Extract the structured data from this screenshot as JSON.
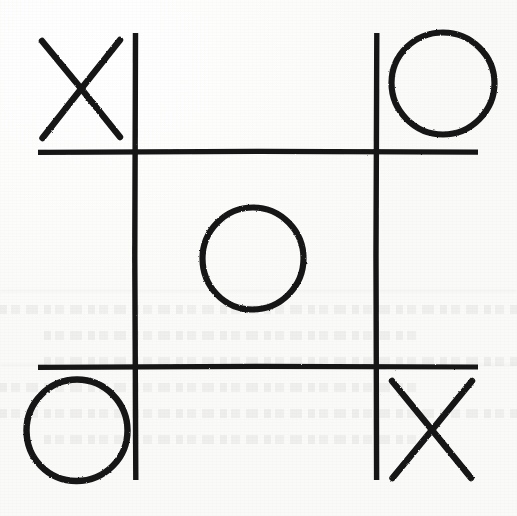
{
  "board": {
    "title": "Tic-Tac-Toe",
    "size": 3,
    "medium": "hand-drawn on paper",
    "ink_color": "#141414",
    "paper_color": "#fdfdfd",
    "stroke_width": 5,
    "grid": {
      "vertical_lines_x": [
        135.5,
        376.5
      ],
      "horizontal_lines_y": [
        152,
        367
      ],
      "vertical_extent_y": [
        33,
        480
      ],
      "horizontal_extent_x": [
        38,
        478
      ]
    },
    "cells": [
      {
        "index": 0,
        "row": 0,
        "col": 1,
        "position": "top-left",
        "mark": "X",
        "label": "X",
        "cx": 81,
        "cy": 89,
        "r": 50
      },
      {
        "index": 1,
        "row": 0,
        "col": 2,
        "position": "top-center",
        "mark": "",
        "label": "",
        "cx": 256,
        "cy": 89,
        "r": 50
      },
      {
        "index": 2,
        "row": 0,
        "col": 3,
        "position": "top-right",
        "mark": "O",
        "label": "O",
        "cx": 443,
        "cy": 83,
        "r": 51
      },
      {
        "index": 3,
        "row": 1,
        "col": 1,
        "position": "middle-left",
        "mark": "",
        "label": "",
        "cx": 81,
        "cy": 259,
        "r": 50
      },
      {
        "index": 4,
        "row": 1,
        "col": 2,
        "position": "middle-center",
        "mark": "O",
        "label": "O",
        "cx": 253,
        "cy": 258,
        "r": 50
      },
      {
        "index": 5,
        "row": 1,
        "col": 3,
        "position": "middle-right",
        "mark": "",
        "label": "",
        "cx": 430,
        "cy": 259,
        "r": 50
      },
      {
        "index": 6,
        "row": 2,
        "col": 1,
        "position": "bottom-left",
        "mark": "O",
        "label": "O",
        "cx": 77,
        "cy": 430,
        "r": 50
      },
      {
        "index": 7,
        "row": 2,
        "col": 2,
        "position": "bottom-center",
        "mark": "",
        "label": "",
        "cx": 256,
        "cy": 430,
        "r": 50
      },
      {
        "index": 8,
        "row": 2,
        "col": 3,
        "position": "bottom-right",
        "mark": "X",
        "label": "X",
        "cx": 432,
        "cy": 430,
        "r": 50
      }
    ],
    "marks_summary": {
      "x_count": 2,
      "o_count": 3,
      "empty_count": 4,
      "x_positions": [
        "top-left",
        "bottom-right"
      ],
      "o_positions": [
        "top-right",
        "middle-center",
        "bottom-left"
      ],
      "empty_positions": [
        "top-center",
        "middle-left",
        "middle-right",
        "bottom-center"
      ]
    },
    "background_note": "faint ghost text bleeding through from the reverse of the sheet"
  }
}
